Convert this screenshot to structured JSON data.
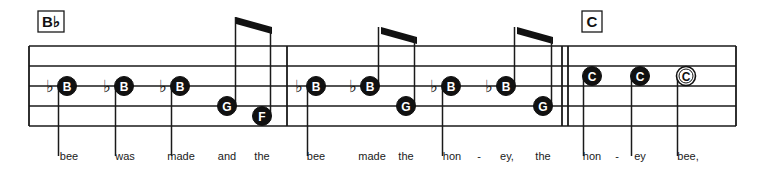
{
  "chords": [
    {
      "label": "B♭",
      "x": 38
    },
    {
      "label": "C",
      "x": 582
    }
  ],
  "staff": {
    "left": 29,
    "right": 736,
    "top": 46,
    "line_spacing": 20,
    "lines": 5,
    "barlines": [
      287,
      562,
      568,
      736
    ]
  },
  "notes": [
    {
      "letter": "B",
      "flat": true,
      "x": 67,
      "y": 86,
      "filled": true,
      "stem": "down"
    },
    {
      "letter": "B",
      "flat": true,
      "x": 124,
      "y": 86,
      "filled": true,
      "stem": "down"
    },
    {
      "letter": "B",
      "flat": true,
      "x": 180,
      "y": 86,
      "filled": true,
      "stem": "down"
    },
    {
      "letter": "G",
      "flat": false,
      "x": 227,
      "y": 106,
      "filled": true,
      "stem": "up-beam"
    },
    {
      "letter": "F",
      "flat": false,
      "x": 262,
      "y": 116,
      "filled": true,
      "stem": "up-beam"
    },
    {
      "letter": "B",
      "flat": true,
      "x": 316,
      "y": 86,
      "filled": true,
      "stem": "down"
    },
    {
      "letter": "B",
      "flat": true,
      "x": 370,
      "y": 86,
      "filled": true,
      "stem": "up-beam"
    },
    {
      "letter": "G",
      "flat": false,
      "x": 406,
      "y": 106,
      "filled": true,
      "stem": "up-beam"
    },
    {
      "letter": "B",
      "flat": true,
      "x": 451,
      "y": 86,
      "filled": true,
      "stem": "down"
    },
    {
      "letter": "B",
      "flat": true,
      "x": 506,
      "y": 86,
      "filled": true,
      "stem": "up-beam"
    },
    {
      "letter": "G",
      "flat": false,
      "x": 543,
      "y": 106,
      "filled": true,
      "stem": "up-beam"
    },
    {
      "letter": "C",
      "flat": false,
      "x": 592,
      "y": 76,
      "filled": true,
      "stem": "down"
    },
    {
      "letter": "C",
      "flat": false,
      "x": 640,
      "y": 76,
      "filled": true,
      "stem": "down"
    },
    {
      "letter": "C",
      "flat": false,
      "x": 686,
      "y": 76,
      "filled": false,
      "stem": "down"
    }
  ],
  "beams": [
    {
      "x1": 236,
      "y1": 17,
      "x2": 272,
      "y2": 27
    },
    {
      "x1": 381,
      "y1": 27,
      "x2": 417,
      "y2": 37
    },
    {
      "x1": 517,
      "y1": 27,
      "x2": 553,
      "y2": 37
    }
  ],
  "lyrics": [
    {
      "text": "bee",
      "x": 69
    },
    {
      "text": "was",
      "x": 125
    },
    {
      "text": "made",
      "x": 181
    },
    {
      "text": "and",
      "x": 227
    },
    {
      "text": "the",
      "x": 262
    },
    {
      "text": "bee",
      "x": 316
    },
    {
      "text": "made",
      "x": 372
    },
    {
      "text": "the",
      "x": 406
    },
    {
      "text": "hon",
      "x": 452
    },
    {
      "text": "-",
      "x": 479
    },
    {
      "text": "ey,",
      "x": 507
    },
    {
      "text": "the",
      "x": 543
    },
    {
      "text": "hon",
      "x": 592
    },
    {
      "text": "-",
      "x": 617
    },
    {
      "text": "ey",
      "x": 640
    },
    {
      "text": "bee,",
      "x": 688
    }
  ]
}
